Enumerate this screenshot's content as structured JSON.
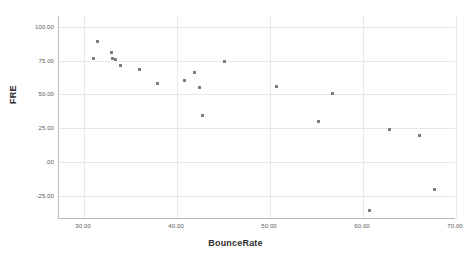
{
  "chart_data": {
    "type": "scatter",
    "title": "",
    "xlabel": "BounceRate",
    "ylabel": "FRE",
    "xlim": [
      27.3,
      70.0
    ],
    "ylim": [
      -42.0,
      108.0
    ],
    "grid": true,
    "legend": false,
    "marker": {
      "shape": "square",
      "color": "#7d7d7d",
      "size_px": 3
    },
    "xticks": [
      30,
      40,
      50,
      60,
      70
    ],
    "xtick_labels": [
      "30.00",
      "40.00",
      "50.00",
      "60.00",
      "70.00"
    ],
    "yticks": [
      -25,
      0,
      25,
      50,
      75,
      100
    ],
    "ytick_labels": [
      "-25.00",
      ".00",
      "25.00",
      "50.00",
      "75.00",
      "100.00"
    ],
    "series": [
      {
        "name": "FRE vs BounceRate",
        "points": [
          {
            "x": 31.4,
            "y": 88.9
          },
          {
            "x": 31.0,
            "y": 76.3
          },
          {
            "x": 32.9,
            "y": 80.7
          },
          {
            "x": 33.1,
            "y": 76.3
          },
          {
            "x": 33.4,
            "y": 75.6
          },
          {
            "x": 33.9,
            "y": 71.1
          },
          {
            "x": 36.0,
            "y": 68.1
          },
          {
            "x": 37.9,
            "y": 57.8
          },
          {
            "x": 40.8,
            "y": 60.7
          },
          {
            "x": 41.9,
            "y": 65.9
          },
          {
            "x": 42.4,
            "y": 54.8
          },
          {
            "x": 42.7,
            "y": 34.8
          },
          {
            "x": 45.1,
            "y": 74.1
          },
          {
            "x": 50.7,
            "y": 55.6
          },
          {
            "x": 55.2,
            "y": 30.4
          },
          {
            "x": 56.7,
            "y": 50.4
          },
          {
            "x": 60.7,
            "y": -35.6
          },
          {
            "x": 62.8,
            "y": 24.4
          },
          {
            "x": 66.1,
            "y": 20.0
          },
          {
            "x": 67.7,
            "y": -20.0
          }
        ]
      }
    ]
  }
}
